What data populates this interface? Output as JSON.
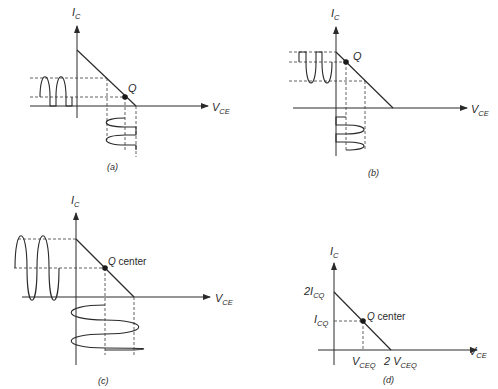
{
  "figure": {
    "panels": [
      {
        "id": "a",
        "caption": "(a)",
        "q_label": "Q",
        "y_axis_label": "I",
        "y_axis_sub": "C",
        "x_axis_label": "V",
        "x_axis_sub": "CE",
        "description": "Q point near cutoff: output clipped at one end"
      },
      {
        "id": "b",
        "caption": "(b)",
        "q_label": "Q",
        "y_axis_label": "I",
        "y_axis_sub": "C",
        "x_axis_label": "V",
        "x_axis_sub": "CE",
        "description": "Q point near saturation: output clipped at the other end"
      },
      {
        "id": "c",
        "caption": "(c)",
        "q_label": "Q",
        "q_suffix": "center",
        "y_axis_label": "I",
        "y_axis_sub": "C",
        "x_axis_label": "V",
        "x_axis_sub": "CE",
        "description": "Centered Q point: maximum unclipped swing"
      },
      {
        "id": "d",
        "caption": "(d)",
        "q_label": "Q",
        "q_suffix": "center",
        "y_axis_label": "I",
        "y_axis_sub": "C",
        "x_axis_label": "V",
        "x_axis_sub": "CE",
        "y_ticks": [
          {
            "label": "2I",
            "sub": "CQ"
          },
          {
            "label": "I",
            "sub": "CQ"
          }
        ],
        "x_ticks": [
          {
            "label": "V",
            "sub": "CEQ"
          },
          {
            "label": "2 V",
            "sub": "CEQ"
          }
        ]
      }
    ]
  }
}
